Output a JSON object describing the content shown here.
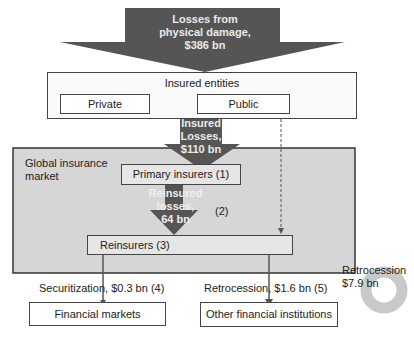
{
  "diagram": {
    "top_arrow": {
      "line1": "Losses from",
      "line2": "physical damage,",
      "line3": "$386 bn"
    },
    "insured_entities": {
      "title": "Insured entities",
      "private": "Private",
      "public": "Public"
    },
    "insured_arrow": {
      "line1": "Insured",
      "line2": "Losses,",
      "line3": "$110 bn"
    },
    "global_market": {
      "line1": "Global insurance",
      "line2": "market"
    },
    "primary_insurers": "Primary insurers  (1)",
    "reinsured_arrow": {
      "line1": "Reinsured",
      "line2": "losses,",
      "line3": "64 bn",
      "note": "(2)"
    },
    "reinsurers": "Reinsurers      (3)",
    "retro_loop": {
      "line1": "Retrocession",
      "line2": "$7.9 bn"
    },
    "securitization": "Securitization, $0.3 bn (4)",
    "retrocession_out": "Retrocession, $1.6 bn (5)",
    "financial_markets": "Financial markets",
    "other_institutions": "Other financial institutions"
  },
  "colors": {
    "arrow": "#555555",
    "market_bg": "#d9d9d9",
    "loop": "#c8c8c8"
  }
}
